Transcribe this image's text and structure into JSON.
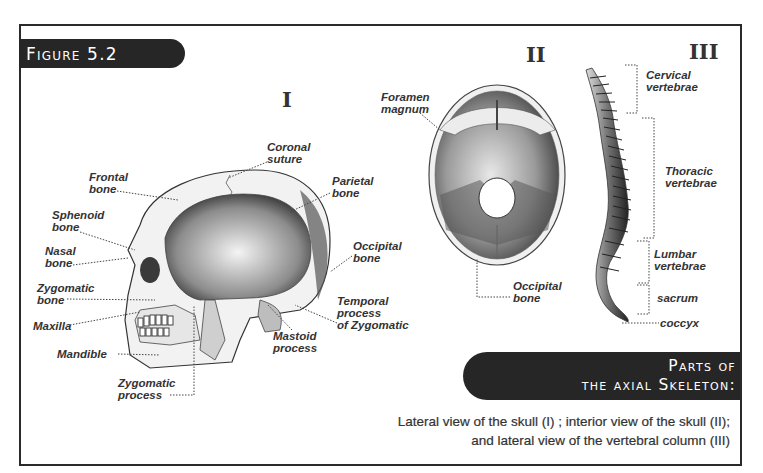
{
  "figure": {
    "label": "Figure 5.2",
    "title_line1": "Parts of",
    "title_line2": "the axial Skeleton:",
    "caption_line1": "Lateral view of the skull (I) ; interior view of the skull (II);",
    "caption_line2": "and lateral view of the vertebral column (III)"
  },
  "panels": [
    {
      "numeral": "I",
      "subject": "Lateral view of the skull",
      "labels": [
        {
          "line1": "Coronal",
          "line2": "suture"
        },
        {
          "line1": "Frontal",
          "line2": "bone"
        },
        {
          "line1": "Parietal",
          "line2": "bone"
        },
        {
          "line1": "Sphenoid",
          "line2": "bone"
        },
        {
          "line1": "Nasal",
          "line2": "bone"
        },
        {
          "line1": "Occipital",
          "line2": "bone"
        },
        {
          "line1": "Zygomatic",
          "line2": "bone"
        },
        {
          "line1": "Temporal",
          "line2": "process",
          "line3": "of Zygomatic"
        },
        {
          "line1": "Maxilla"
        },
        {
          "line1": "Mastoid",
          "line2": "process"
        },
        {
          "line1": "Mandible"
        },
        {
          "line1": "Zygomatic",
          "line2": "process"
        }
      ]
    },
    {
      "numeral": "II",
      "subject": "Interior view of the skull",
      "labels": [
        {
          "line1": "Foramen",
          "line2": "magnum"
        },
        {
          "line1": "Occipital",
          "line2": "bone"
        }
      ]
    },
    {
      "numeral": "III",
      "subject": "Lateral view of the vertebral column",
      "labels": [
        {
          "line1": "Cervical",
          "line2": "vertebrae"
        },
        {
          "line1": "Thoracic",
          "line2": "vertebrae"
        },
        {
          "line1": "Lumbar",
          "line2": "vertebrae"
        },
        {
          "line1": "sacrum"
        },
        {
          "line1": "coccyx"
        }
      ]
    }
  ],
  "colors": {
    "tab_background": "#262626",
    "tab_text": "#ffffff",
    "label_text": "#333333",
    "frame": "#2a2a2a"
  }
}
